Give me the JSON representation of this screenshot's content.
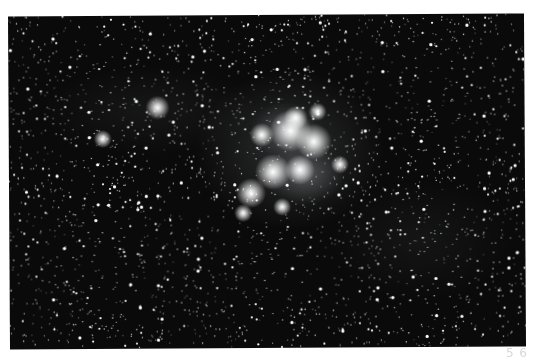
{
  "image": {
    "subject": "Pleiades star cluster (M45) with reflection nebulosity",
    "background_color": "#0a0a0a",
    "star_color": "#ffffff",
    "nebula_color": "#cfd6dc",
    "field_star_count": 2600,
    "nebula_glows": [
      {
        "x": 290,
        "y": 150,
        "rx": 95,
        "ry": 80,
        "opacity": 0.16
      },
      {
        "x": 305,
        "y": 175,
        "rx": 40,
        "ry": 30,
        "opacity": 0.28
      },
      {
        "x": 285,
        "y": 130,
        "rx": 35,
        "ry": 28,
        "opacity": 0.22
      },
      {
        "x": 150,
        "y": 110,
        "rx": 110,
        "ry": 45,
        "opacity": 0.06
      },
      {
        "x": 420,
        "y": 240,
        "rx": 90,
        "ry": 60,
        "opacity": 0.05
      }
    ],
    "bright_stars": [
      {
        "x": 291,
        "y": 131,
        "r": 7
      },
      {
        "x": 314,
        "y": 142,
        "r": 6
      },
      {
        "x": 262,
        "y": 135,
        "r": 4
      },
      {
        "x": 273,
        "y": 172,
        "r": 6
      },
      {
        "x": 300,
        "y": 170,
        "r": 5
      },
      {
        "x": 251,
        "y": 193,
        "r": 5
      },
      {
        "x": 296,
        "y": 118,
        "r": 4
      },
      {
        "x": 282,
        "y": 207,
        "r": 3
      },
      {
        "x": 158,
        "y": 107,
        "r": 4
      },
      {
        "x": 103,
        "y": 138,
        "r": 3
      },
      {
        "x": 318,
        "y": 112,
        "r": 3
      },
      {
        "x": 243,
        "y": 213,
        "r": 3
      },
      {
        "x": 340,
        "y": 165,
        "r": 3
      }
    ]
  },
  "caption": {
    "text": "5 6"
  }
}
